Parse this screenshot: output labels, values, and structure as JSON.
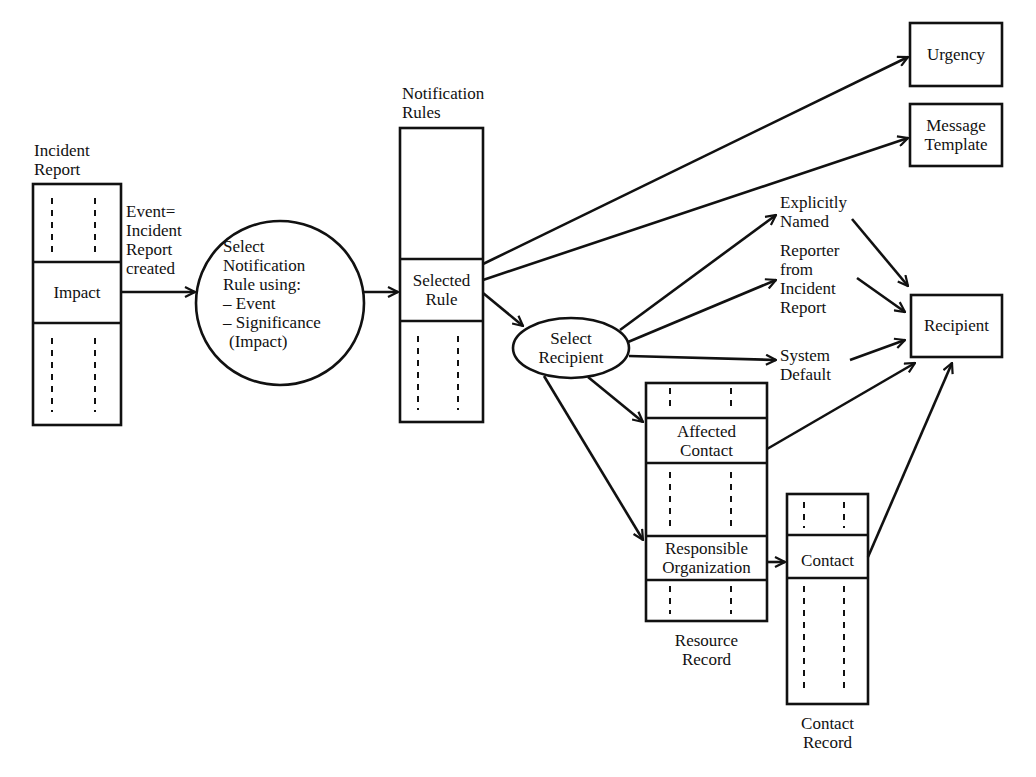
{
  "incident_report": {
    "title_line1": "Incident",
    "title_line2": "Report",
    "field": "Impact"
  },
  "event_label": {
    "l1": "Event=",
    "l2": "Incident",
    "l3": "Report",
    "l4": "created"
  },
  "select_rule": {
    "l1": "Select",
    "l2": "Notification",
    "l3": "Rule using:",
    "l4": "– Event",
    "l5": "– Significance",
    "l6": "(Impact)"
  },
  "notification_rules": {
    "title_line1": "Notification",
    "title_line2": "Rules",
    "field_line1": "Selected",
    "field_line2": "Rule"
  },
  "select_recipient": {
    "l1": "Select",
    "l2": "Recipient"
  },
  "outputs": {
    "urgency": "Urgency",
    "message_l1": "Message",
    "message_l2": "Template",
    "recipient": "Recipient"
  },
  "recipient_sources": {
    "explicit_l1": "Explicitly",
    "explicit_l2": "Named",
    "reporter_l1": "Reporter",
    "reporter_l2": "from",
    "reporter_l3": "Incident",
    "reporter_l4": "Report",
    "system_l1": "System",
    "system_l2": "Default"
  },
  "resource_record": {
    "field1_l1": "Affected",
    "field1_l2": "Contact",
    "field2_l1": "Responsible",
    "field2_l2": "Organization",
    "title_l1": "Resource",
    "title_l2": "Record"
  },
  "contact_record": {
    "field": "Contact",
    "title_l1": "Contact",
    "title_l2": "Record"
  }
}
